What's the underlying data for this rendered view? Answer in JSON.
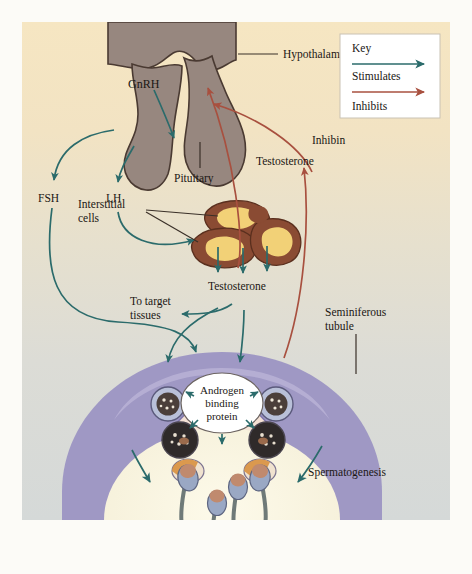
{
  "figure": {
    "type": "biological-flow-diagram",
    "canvas": {
      "width": 472,
      "height": 574
    },
    "diagram_area": {
      "x": 22,
      "y": 22,
      "width": 428,
      "height": 498
    }
  },
  "key": {
    "title": "Key",
    "entries": [
      {
        "label": "Stimulates",
        "color": "#2b6b6b",
        "arrow": "solid-arrow-right"
      },
      {
        "label": "Inhibits",
        "color": "#a8503f",
        "arrow": "solid-arrow-right"
      }
    ]
  },
  "labels": {
    "hypothalamus": "Hypothalamus",
    "gnrh": "GnRH",
    "pituitary": "Pituitary",
    "fsh": "FSH",
    "lh": "LH",
    "interstitial_cells": "Interstitial\ncells",
    "interstitial_cells_line1": "Interstitial",
    "interstitial_cells_line2": "cells",
    "testosterone_upper": "Testosterone",
    "testosterone_lower": "Testosterone",
    "inhibin": "Inhibin",
    "to_target_line1": "To target",
    "to_target_line2": "tissues",
    "seminiferous_line1": "Seminiferous",
    "seminiferous_line2": "tubule",
    "androgen_line1": "Androgen",
    "androgen_line2": "binding",
    "androgen_line3": "protein",
    "spermatogenesis": "Spermatogenesis"
  },
  "colors": {
    "background_top": "#f6e6c4",
    "background_bottom": "#d8dcd8",
    "page": "#fcfbf7",
    "gland": "#97877f",
    "gland_outline": "#4a3a32",
    "interstitial_outer": "#8a4b33",
    "interstitial_inner": "#f2d177",
    "tubule_outer": "#9f98c4",
    "tubule_inner": "#f2ddd0",
    "lumen": "#f7f2dc",
    "stimulate_arrow": "#2b6b6b",
    "inhibit_arrow": "#a8503f",
    "leader_line": "#3a3028",
    "text": "#1b1714",
    "sperm_head": "#9aa8c4",
    "sperm_nucleus": "#c08a6e",
    "spermatid": "#d8913f"
  },
  "pathways": {
    "stimulates": [
      {
        "from": "Hypothalamus",
        "to": "Pituitary",
        "signal": "GnRH"
      },
      {
        "from": "Pituitary",
        "to": "FSH",
        "signal": "FSH"
      },
      {
        "from": "Pituitary",
        "to": "LH",
        "signal": "LH"
      },
      {
        "from": "LH",
        "to": "Interstitial cells",
        "signal": "LH"
      },
      {
        "from": "Interstitial cells",
        "to": "Testosterone",
        "signal": "Testosterone"
      },
      {
        "from": "Testosterone",
        "to": "To target tissues",
        "signal": "Testosterone"
      },
      {
        "from": "Testosterone",
        "to": "Seminiferous tubule",
        "signal": "Testosterone"
      },
      {
        "from": "FSH",
        "to": "Seminiferous tubule",
        "signal": "FSH"
      },
      {
        "from": "Androgen binding protein",
        "to": "Spermatogenesis",
        "signal": "ABP"
      }
    ],
    "inhibits": [
      {
        "from": "Testosterone",
        "to": "Hypothalamus",
        "signal": "Testosterone"
      },
      {
        "from": "Inhibin",
        "to": "Hypothalamus",
        "signal": "Inhibin"
      }
    ]
  }
}
